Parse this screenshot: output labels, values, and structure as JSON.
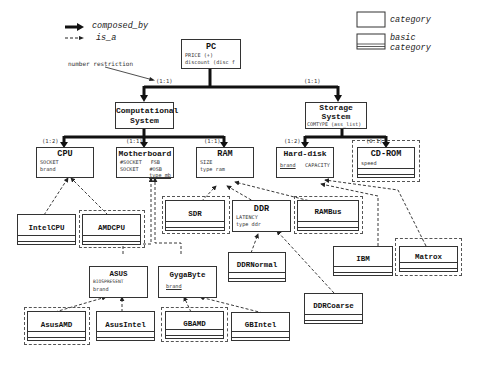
{
  "legend": {
    "composed_by": "composed_by",
    "is_a": "is_a",
    "category": "category",
    "basic_category_line1": "basic",
    "basic_category_line2": "category"
  },
  "annotation": {
    "number_restriction": "number restriction"
  },
  "cardinalities": {
    "pc_comp": "(1:1)",
    "pc_storage": "(1:1)",
    "cpu": "(1:2)",
    "motherboard": "(1:1)",
    "ram": "(1:1)",
    "harddisk": "(1:2)",
    "cdrom": "(0:1)"
  },
  "nodes": {
    "pc": {
      "title": "PC",
      "attrs": [
        "PRICE (+)",
        "discount (disc_f"
      ]
    },
    "computational": {
      "title_line1": "Computational",
      "title_line2": "System"
    },
    "storage": {
      "title_line1": "Storage",
      "title_line2": "System",
      "attrs": [
        "COMTYPE (ass_list)"
      ]
    },
    "cpu": {
      "title": "CPU",
      "attrs": [
        "SOCKET"
      ],
      "underlined": "brand"
    },
    "motherboard": {
      "title": "Motherboard",
      "col1": [
        "#SOCKET",
        "SOCKET"
      ],
      "col2": [
        "FSB",
        "#OSB"
      ],
      "underlined": "type_mb"
    },
    "ram": {
      "title": "RAM",
      "attrs": [
        "SIZE"
      ],
      "underlined": "type_ram"
    },
    "harddisk": {
      "title": "Hard-disk",
      "underlined": "brand",
      "attr2": "CAPACITY"
    },
    "cdrom": {
      "title": "CD-ROM",
      "attrs": [
        "speed"
      ]
    },
    "intelcpu": {
      "title": "IntelCPU"
    },
    "amdcpu": {
      "title": "AMDCPU"
    },
    "sdr": {
      "title": "SDR"
    },
    "ddr": {
      "title": "DDR",
      "attrs": [
        "LATENCY"
      ],
      "underlined": "type_ddr"
    },
    "rambus": {
      "title": "RAMBus"
    },
    "ddrnormal": {
      "title": "DDRNormal"
    },
    "ddrcoarse": {
      "title": "DDRCoarse"
    },
    "asus": {
      "title": "ASUS",
      "attrs": [
        "BIOSPRESENT"
      ],
      "underlined": "brand"
    },
    "gygabyte": {
      "title": "GygaByte",
      "underlined": "brand"
    },
    "asusamd": {
      "title": "AsusAMD"
    },
    "asusintel": {
      "title": "AsusIntel"
    },
    "gbamd": {
      "title": "GBAMD"
    },
    "gbintel": {
      "title": "GBIntel"
    },
    "ibm": {
      "title": "IBM"
    },
    "matrox": {
      "title": "Matrox"
    }
  },
  "colors": {
    "line": "#111111",
    "border": "#333333",
    "background": "#ffffff"
  }
}
